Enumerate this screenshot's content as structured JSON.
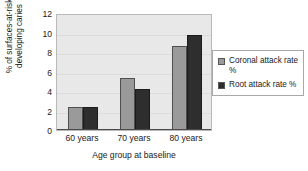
{
  "chart_data": {
    "type": "bar",
    "title": "",
    "xlabel": "Age group at baseline",
    "ylabel": "% of surfaces-at-risk\ndeveloping caries",
    "categories": [
      "60 years",
      "70 years",
      "80 years"
    ],
    "series": [
      {
        "name": "Coronal attack rate %",
        "color": "#9a9a9a",
        "values": [
          2.4,
          5.3,
          8.6
        ]
      },
      {
        "name": "Root attack rate %",
        "color": "#2e2e2e",
        "values": [
          2.4,
          4.2,
          9.7
        ]
      }
    ],
    "ylim": [
      0,
      12
    ],
    "ytick_step": 2,
    "yticks": [
      "0",
      "2",
      "4",
      "6",
      "8",
      "10",
      "12"
    ],
    "grid": true,
    "legend_position": "right"
  },
  "legend": {
    "entries": [
      {
        "label": "Coronal attack rate %"
      },
      {
        "label": "Root attack rate %"
      }
    ]
  }
}
